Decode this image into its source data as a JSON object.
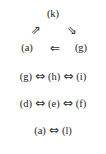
{
  "triangle": {
    "top": "(k)",
    "left": "(a)",
    "right": "(g)",
    "arrow_left_up": "⇗",
    "arrow_right_down": "⇘",
    "arrow_bottom": "⇐"
  },
  "rows": [
    {
      "items": [
        "(g)",
        "(h)",
        "(i)"
      ],
      "connector": "⇔"
    },
    {
      "items": [
        "(d)",
        "(e)",
        "(f)"
      ],
      "connector": "⇔"
    },
    {
      "items": [
        "(a)",
        "(l)"
      ],
      "connector": "⇔"
    }
  ]
}
